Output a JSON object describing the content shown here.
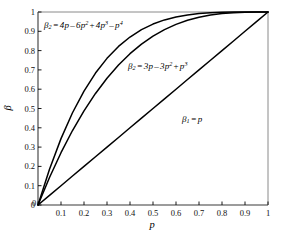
{
  "chart_data": {
    "type": "line",
    "title": "",
    "subtitle": "",
    "xlabel": "p",
    "ylabel": "β",
    "xlim": [
      0,
      1
    ],
    "ylim": [
      0,
      1
    ],
    "grid": false,
    "legend_position": "inline-annotations",
    "x_ticks": [
      "0",
      "0.1",
      "0.2",
      "0.3",
      "0.4",
      "0.5",
      "0.6",
      "0.7",
      "0.8",
      "0.9",
      "1"
    ],
    "x_tick_values": [
      0,
      0.1,
      0.2,
      0.3,
      0.4,
      0.5,
      0.6,
      0.7,
      0.8,
      0.9,
      1
    ],
    "y_ticks": [
      "0",
      "0.1",
      "0.2",
      "0.3",
      "0.4",
      "0.5",
      "0.6",
      "0.7",
      "0.8",
      "0.9",
      "1"
    ],
    "y_tick_values": [
      0,
      0.1,
      0.2,
      0.3,
      0.4,
      0.5,
      0.6,
      0.7,
      0.8,
      0.9,
      1
    ],
    "line_color": "#000000",
    "axis_color": "#000000",
    "background_color": "#ffffff",
    "x": [
      0,
      0.05,
      0.1,
      0.15,
      0.2,
      0.25,
      0.3,
      0.35,
      0.4,
      0.45,
      0.5,
      0.55,
      0.6,
      0.65,
      0.7,
      0.75,
      0.8,
      0.85,
      0.9,
      0.95,
      1
    ],
    "series": [
      {
        "name": "beta_4",
        "label": "β₂ = 4p − 6p² + 4p³ − p⁴",
        "expression": "4p - 6p^2 + 4p^3 - p^4",
        "values": [
          0,
          0.1855,
          0.3439,
          0.478,
          0.5904,
          0.6836,
          0.7599,
          0.8215,
          0.8704,
          0.9085,
          0.9375,
          0.959,
          0.9744,
          0.985,
          0.9919,
          0.9961,
          0.9984,
          0.9995,
          0.9999,
          1.0,
          1.0
        ]
      },
      {
        "name": "beta_3",
        "label": "β₂ = 3p − 3p² + p³",
        "expression": "3p - 3p^2 + p^3",
        "values": [
          0,
          0.1426,
          0.271,
          0.3859,
          0.488,
          0.5781,
          0.657,
          0.7254,
          0.784,
          0.8336,
          0.875,
          0.9089,
          0.936,
          0.9571,
          0.973,
          0.9844,
          0.992,
          0.9966,
          0.999,
          0.9999,
          1.0
        ]
      },
      {
        "name": "beta_1",
        "label": "β₁ = p",
        "expression": "p",
        "values": [
          0,
          0.05,
          0.1,
          0.15,
          0.2,
          0.25,
          0.3,
          0.35,
          0.4,
          0.45,
          0.5,
          0.55,
          0.6,
          0.65,
          0.7,
          0.75,
          0.8,
          0.85,
          0.9,
          0.95,
          1
        ]
      }
    ]
  },
  "annotations": {
    "beta2_top": {
      "symbol": "β",
      "sub": "2",
      "eq": "=",
      "terms": [
        {
          "coef": "4",
          "var": "p",
          "exp": "",
          "op": ""
        },
        {
          "coef": "6",
          "var": "p",
          "exp": "2",
          "op": "–"
        },
        {
          "coef": "4",
          "var": "p",
          "exp": "3",
          "op": "+"
        },
        {
          "coef": "",
          "var": "p",
          "exp": "4",
          "op": "–"
        }
      ]
    },
    "beta2_mid": {
      "symbol": "β",
      "sub": "2",
      "eq": "=",
      "terms": [
        {
          "coef": "3",
          "var": "p",
          "exp": "",
          "op": ""
        },
        {
          "coef": "3",
          "var": "p",
          "exp": "2",
          "op": "–"
        },
        {
          "coef": "",
          "var": "p",
          "exp": "3",
          "op": "+"
        }
      ]
    },
    "beta1": {
      "symbol": "β",
      "sub": "1",
      "eq": "=",
      "terms": [
        {
          "coef": "",
          "var": "p",
          "exp": "",
          "op": ""
        }
      ]
    }
  },
  "axes": {
    "x_title": "p",
    "y_title": "β"
  }
}
